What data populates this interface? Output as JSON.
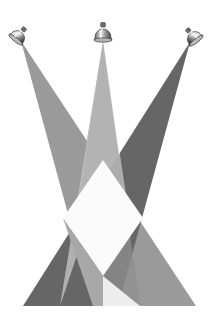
{
  "scene": {
    "title": "Three Crossing Spotlight Beams",
    "description": "Three ceiling-mounted bell-shaped spotlight fixtures at the top cast wide triangular light beams downward that cross each other, forming a bright diamond in the centre and overlapping grey wedges at the bottom.",
    "canvas": {
      "width": 215,
      "height": 318
    },
    "background_color": "#ffffff",
    "floor_y": 306
  },
  "palette": {
    "background": "#ffffff",
    "beam_left": "#9a9a9a",
    "beam_center": "#808080",
    "beam_right": "#666666",
    "overlap_bright": "#fbfbfb",
    "overlap_light": "#ededed",
    "overlap_mid": "#a8a8a8",
    "fixture_body_dark": "#4a4a4a",
    "fixture_body_mid": "#8d8d8d",
    "fixture_body_light": "#d8d8d8",
    "fixture_highlight": "#f2f2f2",
    "fixture_outline": "#3a3a3a"
  },
  "fixtures": [
    {
      "id": "fixture-left",
      "label": "Left spotlight",
      "x": 21,
      "y": 35,
      "tilt_degrees": 38,
      "aim": "down-right",
      "beam_color": "#9a9a9a"
    },
    {
      "id": "fixture-center",
      "label": "Center spotlight",
      "x": 103,
      "y": 32,
      "tilt_degrees": 0,
      "aim": "down",
      "beam_color": "#808080"
    },
    {
      "id": "fixture-right",
      "label": "Right spotlight",
      "x": 191,
      "y": 36,
      "tilt_degrees": -38,
      "aim": "down-left",
      "beam_color": "#666666"
    }
  ],
  "beams": [
    {
      "id": "beam-left",
      "label": "Left beam",
      "source": "fixture-left",
      "color": "#9a9a9a",
      "apex": [
        21,
        41
      ],
      "base_left": [
        93,
        306
      ],
      "base_right": [
        196,
        306
      ]
    },
    {
      "id": "beam-center",
      "label": "Center beam",
      "source": "fixture-center",
      "color": "#808080",
      "apex": [
        103,
        42
      ],
      "base_left": [
        60,
        306
      ],
      "base_right": [
        140,
        306
      ]
    },
    {
      "id": "beam-right",
      "label": "Right beam",
      "source": "fixture-right",
      "color": "#666666",
      "apex": [
        190,
        42
      ],
      "base_left": [
        23,
        306
      ],
      "base_right": [
        118,
        306
      ]
    }
  ],
  "overlaps": [
    {
      "id": "overlap-center-diamond",
      "label": "Central bright diamond where all three beams meet",
      "color": "#fbfbfb"
    },
    {
      "id": "overlap-lower-right",
      "label": "Bright wedge at lower right",
      "color": "#ededed"
    },
    {
      "id": "overlap-lower-left",
      "label": "Mid-tone wedge at lower left",
      "color": "#a8a8a8"
    }
  ]
}
